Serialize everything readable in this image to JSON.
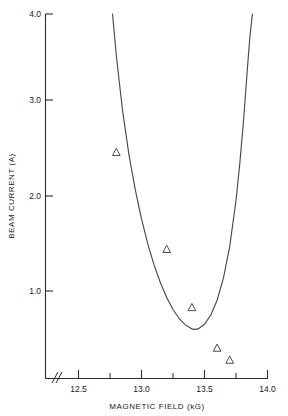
{
  "chart_data": {
    "type": "scatter",
    "title": "",
    "xlabel": "MAGNETIC FIELD (kG)",
    "ylabel": "BEAM CURRENT (A)",
    "xlim": [
      12.3,
      14.0
    ],
    "ylim": [
      0.0,
      4.0
    ],
    "grid": false,
    "legend": null,
    "axis_break": {
      "present": true,
      "symbol": "//",
      "axis": "x",
      "at": 12.38
    },
    "xticks": [
      12.5,
      13.0,
      13.5,
      14.0
    ],
    "xtick_labels": [
      "12.5",
      "13.0",
      "13.5",
      "14.0"
    ],
    "xticks_minor": [
      12.75,
      13.25,
      13.75
    ],
    "yticks": [
      1.0,
      2.0,
      3.0,
      4.0
    ],
    "ytick_labels": [
      "1.0",
      "2.0",
      "3.0",
      "4.0"
    ],
    "series": [
      {
        "name": "measured",
        "type": "scatter",
        "marker": "triangle-up-open",
        "x": [
          12.8,
          13.2,
          13.4,
          13.6,
          13.7
        ],
        "y": [
          2.5,
          1.45,
          0.82,
          0.38,
          0.25
        ]
      },
      {
        "name": "theory",
        "type": "line",
        "x": [
          12.77,
          12.8,
          12.85,
          12.9,
          12.95,
          13.0,
          13.05,
          13.1,
          13.15,
          13.2,
          13.25,
          13.3,
          13.35,
          13.4,
          13.42,
          13.45,
          13.5,
          13.55,
          13.6,
          13.65,
          13.7,
          13.75,
          13.78,
          13.81,
          13.84,
          13.86,
          13.88
        ],
        "y": [
          4.0,
          3.55,
          2.95,
          2.48,
          2.1,
          1.78,
          1.51,
          1.28,
          1.09,
          0.93,
          0.8,
          0.7,
          0.63,
          0.59,
          0.585,
          0.59,
          0.64,
          0.74,
          0.9,
          1.14,
          1.48,
          1.98,
          2.38,
          2.85,
          3.4,
          3.75,
          4.0
        ]
      }
    ]
  },
  "figure": {
    "background_color": "#ffffff",
    "line_color": "#4a4a4a",
    "axis_color": "#2b2b2b"
  }
}
